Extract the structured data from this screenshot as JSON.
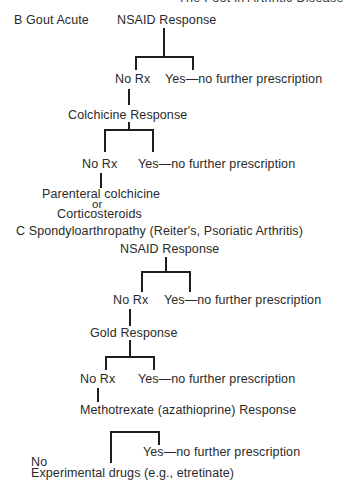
{
  "header": {
    "running_title": "The Foot in Arthritic Disease"
  },
  "section_b": {
    "label": "B Gout Acute",
    "nsaid_response": "NSAID Response",
    "nsaid_no": "No Rx",
    "nsaid_yes": "Yes—no further prescription",
    "colchicine_response": "Colchicine Response",
    "colchicine_no": "No Rx",
    "colchicine_yes": "Yes—no further prescription",
    "final_line1": "Parenteral colchicine",
    "final_or": "or",
    "final_line2": "Corticosteroids"
  },
  "section_c": {
    "label": "C Spondyloarthropathy (Reiter's, Psoriatic Arthritis)",
    "nsaid_response": "NSAID Response",
    "nsaid_no": "No Rx",
    "nsaid_yes": "Yes—no further prescription",
    "gold_response": "Gold Response",
    "gold_no": "No Rx",
    "gold_yes": "Yes—no further prescription",
    "methotrexate_response": "Methotrexate (azathioprine) Response",
    "methotrexate_no": "No",
    "methotrexate_yes": "Yes—no further prescription",
    "final": "Experimental drugs (e.g., etretinate)"
  }
}
